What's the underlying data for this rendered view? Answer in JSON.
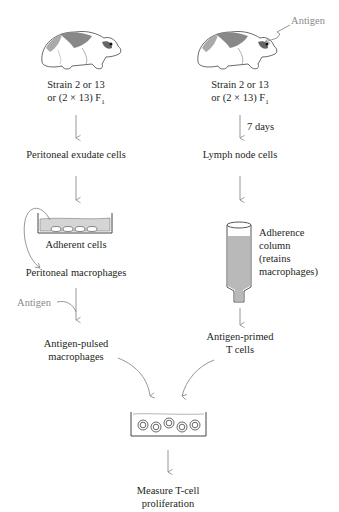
{
  "left_column": {
    "animal_label_line1": "Strain 2 or 13",
    "animal_label_line2": "or (2 × 13) F",
    "animal_label_sub": "1",
    "step1": "Peritoneal exudate cells",
    "dish_label": "Adherent cells",
    "step2": "Peritoneal macrophages",
    "antigen_label": "Antigen",
    "step3_line1": "Antigen-pulsed",
    "step3_line2": "macrophages"
  },
  "right_column": {
    "antigen_label": "Antigen",
    "animal_label_line1": "Strain 2 or 13",
    "animal_label_line2": "or (2 × 13) F",
    "animal_label_sub": "1",
    "time_label": "7 days",
    "step1": "Lymph node cells",
    "column_label_line1": "Adherence",
    "column_label_line2": "column",
    "column_label_line3": "(retains",
    "column_label_line4": "macrophages)",
    "step2_line1": "Antigen-primed",
    "step2_line2": "T cells"
  },
  "bottom": {
    "result_line1": "Measure T-cell",
    "result_line2": "proliferation"
  },
  "colors": {
    "text": "#231f20",
    "arrow": "#8a8a8a",
    "fluid": "#c8c8c8",
    "outline": "#555555"
  }
}
